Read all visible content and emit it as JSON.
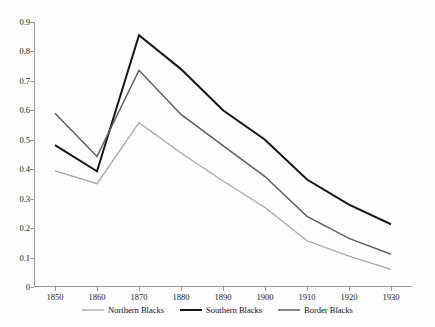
{
  "chart_data": {
    "type": "line",
    "title": "",
    "subtitle": "",
    "xlabel": "",
    "ylabel": "",
    "x": [
      1850,
      1860,
      1870,
      1880,
      1890,
      1900,
      1910,
      1920,
      1930
    ],
    "xtick_labels": [
      "1850",
      "1860",
      "1870",
      "1880",
      "1890",
      "1900",
      "1910",
      "1920",
      "1930"
    ],
    "ytick_labels": [
      "0",
      "0.1",
      "0.2",
      "0.3",
      "0.4",
      "0.5",
      "0.6",
      "0.7",
      "0.8",
      "0.9"
    ],
    "ytick_values": [
      0,
      0.1,
      0.2,
      0.3,
      0.4,
      0.5,
      0.6,
      0.7,
      0.8,
      0.9
    ],
    "xlim": [
      1845,
      1935
    ],
    "ylim": [
      0,
      0.9
    ],
    "grid": false,
    "legend_position": "bottom-center",
    "series": [
      {
        "name": "Northern Blacks",
        "color": "#a8a8a8",
        "width": 1.3,
        "values": [
          0.394,
          0.351,
          0.558,
          0.455,
          0.36,
          0.27,
          0.157,
          0.105,
          0.06
        ]
      },
      {
        "name": "Southern Blacks",
        "color": "#161616",
        "width": 2.0,
        "values": [
          0.482,
          0.393,
          0.855,
          0.74,
          0.6,
          0.5,
          0.365,
          0.28,
          0.213
        ]
      },
      {
        "name": "Border Blacks",
        "color": "#5e5e5e",
        "width": 1.5,
        "values": [
          0.59,
          0.443,
          0.736,
          0.586,
          0.48,
          0.375,
          0.24,
          0.165,
          0.111
        ]
      }
    ]
  },
  "legend": {
    "items": [
      {
        "label": "Northern Blacks",
        "color": "#a8a8a8",
        "width": 1.3
      },
      {
        "label": "Southern Blacks",
        "color": "#161616",
        "width": 2.0
      },
      {
        "label": "Border Blacks",
        "color": "#5e5e5e",
        "width": 1.5
      }
    ]
  },
  "axes": {
    "axis_color": "#9a9a9a",
    "label_color": "#1a1a1a"
  }
}
